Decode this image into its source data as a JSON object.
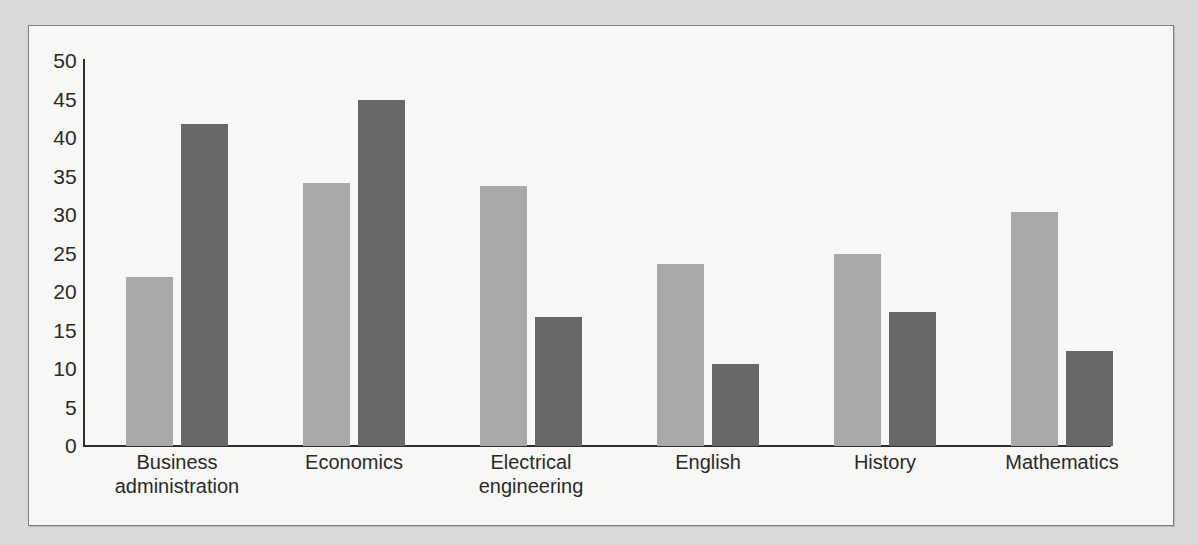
{
  "figure": {
    "background_color": "#f7f7f5",
    "frame_border_color": "#7d7f82",
    "page_background_color": "#d9d9d9"
  },
  "chart_data": {
    "type": "bar",
    "title": "",
    "subtitle": "",
    "xlabel": "",
    "ylabel": "",
    "grid": false,
    "legend": "none",
    "ylim": [
      0,
      50
    ],
    "ytick_labels": [
      "50",
      "45",
      "40",
      "35",
      "30",
      "25",
      "20",
      "15",
      "10",
      "5",
      "0"
    ],
    "yticks": [
      50,
      45,
      40,
      35,
      30,
      25,
      20,
      15,
      10,
      5,
      0
    ],
    "categories": [
      "Business administration",
      "Economics",
      "Electrical engineering",
      "English",
      "History",
      "Mathematics"
    ],
    "category_lines": [
      [
        "Business",
        "administration"
      ],
      [
        "Economics",
        ""
      ],
      [
        "Electrical",
        "engineering"
      ],
      [
        "English",
        ""
      ],
      [
        "History",
        ""
      ],
      [
        "Mathematics",
        ""
      ]
    ],
    "series": [
      {
        "name": "series-a",
        "color": "#a9a9a9",
        "values": [
          21.9,
          34.2,
          33.8,
          23.6,
          24.9,
          30.4
        ]
      },
      {
        "name": "series-b",
        "color": "#686868",
        "values": [
          41.8,
          44.9,
          16.8,
          10.6,
          17.4,
          12.4
        ]
      }
    ]
  }
}
